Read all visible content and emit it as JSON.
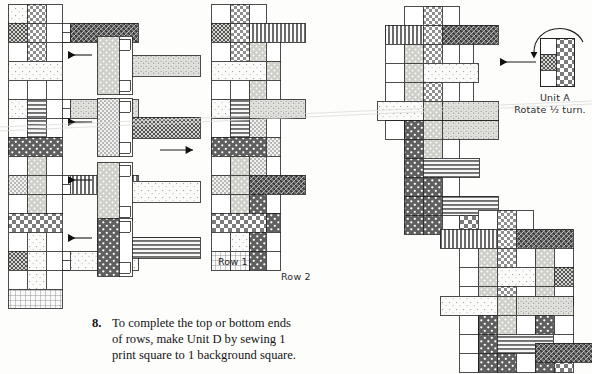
{
  "page": {
    "width": 592,
    "height": 374,
    "background": "#fdfdfc",
    "ink": "#1a1a1a"
  },
  "labels": {
    "row1": "Row 1",
    "row2": "Row 2",
    "unit_a_name": "Unit A",
    "unit_a_action": "Rotate ½ turn."
  },
  "instruction": {
    "number": "8.",
    "line1": "To complete the top or bottom ends",
    "line2": "of rows, make Unit D by sewing 1",
    "line3": "print square to 1 background square."
  },
  "arrows": [
    {
      "name": "arrow-left-row1-top",
      "direction": "left",
      "x1": 92,
      "y1": 55,
      "x2": 63,
      "y2": 55
    },
    {
      "name": "arrow-left-row1-middle",
      "direction": "left",
      "x1": 92,
      "y1": 122,
      "x2": 63,
      "y2": 122
    },
    {
      "name": "arrow-left-row1-lower",
      "direction": "left",
      "x1": 92,
      "y1": 178,
      "x2": 63,
      "y2": 178
    },
    {
      "name": "arrow-left-row1-bottom",
      "direction": "left",
      "x1": 92,
      "y1": 238,
      "x2": 63,
      "y2": 238
    },
    {
      "name": "arrow-right-assembly",
      "direction": "right",
      "x1": 158,
      "y1": 150,
      "x2": 200,
      "y2": 150
    },
    {
      "name": "arrow-left-unit-a",
      "direction": "left",
      "x1": 540,
      "y1": 62,
      "x2": 498,
      "y2": 62
    }
  ],
  "rotation_arrow": {
    "name": "rotate-half-turn-arrow",
    "path": "M 531 55 C 533 27 570 22 581 41",
    "head_at": [
      531,
      56
    ]
  },
  "patterns": {
    "background_plain": "#ffffff",
    "light_dots": "#f4f4f2",
    "medium_dots": "#bdbdbd",
    "dark_dots": "#6e6e6e",
    "checker": "#9a9a9a",
    "vertical_stripe": "#8a8a8a",
    "horizontal_stripe": "#9c9c9c",
    "crosshatch": "#767676",
    "speckle": "#c8c8c8",
    "dark_weave": "#5a5a5a",
    "outline": "#1a1a1a"
  },
  "blocks": {
    "row1_strip": {
      "name": "row-1-pieced-strip",
      "x": 8,
      "y": 4,
      "cell": 19,
      "cols": 3,
      "rows": 14,
      "cells": [
        [
          "light_dots",
          "checker",
          "background_plain"
        ],
        [
          "crosshatch",
          "checker",
          "horizontal_stripe"
        ],
        [
          "background_plain",
          "checker",
          "horizontal_stripe"
        ],
        [
          "light_dots",
          "light_dots",
          "light_dots"
        ],
        [
          "background_plain",
          "background_plain",
          "background_plain"
        ],
        [
          "light_dots",
          "horizontal_stripe",
          "speckle"
        ],
        [
          "background_plain",
          "horizontal_stripe",
          "speckle"
        ],
        [
          "dark_dots",
          "dark_dots",
          "dark_dots"
        ],
        [
          "background_plain",
          "medium_dots",
          "background_plain"
        ],
        [
          "checker",
          "medium_dots",
          "vertical_stripe"
        ],
        [
          "background_plain",
          "medium_dots",
          "vertical_stripe"
        ],
        [
          "checker",
          "checker",
          "checker"
        ],
        [
          "background_plain",
          "light_dots",
          "background_plain"
        ],
        [
          "crosshatch",
          "light_dots",
          "light_dots"
        ]
      ]
    },
    "units": [
      {
        "name": "unit-t-1",
        "x": 97,
        "y": 36,
        "cell": 19,
        "stem": "medium_dots",
        "arm": "speckle"
      },
      {
        "name": "unit-t-2",
        "x": 97,
        "y": 98,
        "cell": 19,
        "stem": "checker",
        "arm": "crosshatch"
      },
      {
        "name": "unit-t-3",
        "x": 97,
        "y": 162,
        "cell": 19,
        "stem": "medium_dots",
        "arm": "light_dots"
      },
      {
        "name": "unit-t-4",
        "x": 97,
        "y": 218,
        "cell": 19,
        "stem": "dark_dots",
        "arm": "horizontal_stripe"
      }
    ],
    "row2_strip": {
      "name": "row-2-pieced-strip",
      "x": 211,
      "y": 4,
      "cell": 19,
      "cols": 3,
      "rows": 14
    },
    "assembled_middle": {
      "name": "assembled-rows-block-middle",
      "x": 404,
      "y": 6,
      "cell": 19
    },
    "assembled_bottom": {
      "name": "assembled-rows-block-bottom",
      "x": 438,
      "y": 210,
      "cell": 19
    },
    "unit_a": {
      "name": "unit-a-swatch",
      "x": 540,
      "y": 38,
      "cell": 16
    }
  }
}
